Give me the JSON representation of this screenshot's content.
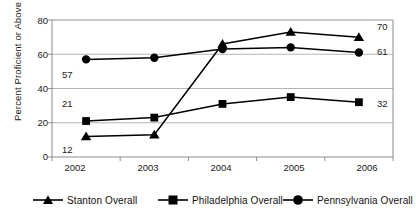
{
  "chart_data": {
    "type": "line",
    "title": "",
    "subtitle": "",
    "xlabel": "",
    "ylabel": "Percent Proficient or Above",
    "categories": [
      "2002",
      "2003",
      "2004",
      "2005",
      "2006"
    ],
    "xtick_labels": [
      "2002",
      "2003",
      "2004",
      "2005",
      "2006"
    ],
    "ytick_labels": [
      "0",
      "20",
      "40",
      "60",
      "80"
    ],
    "ytick_values": [
      0,
      20,
      40,
      60,
      80
    ],
    "ylim": [
      0,
      80
    ],
    "grid": "horizontal",
    "legend_position": "bottom",
    "series": [
      {
        "name": "Stanton Overall",
        "marker": "triangle",
        "color": "#000000",
        "values": [
          12,
          13,
          66,
          73,
          70
        ],
        "point_labels": [
          "12",
          "",
          "",
          "",
          "70"
        ]
      },
      {
        "name": "Philadelphia Overall",
        "marker": "square",
        "color": "#000000",
        "values": [
          21,
          23,
          31,
          35,
          32
        ],
        "point_labels": [
          "21",
          "",
          "",
          "",
          "32"
        ]
      },
      {
        "name": "Pennsylvania Overall",
        "marker": "circle",
        "color": "#000000",
        "values": [
          57,
          58,
          63,
          64,
          61
        ],
        "point_labels": [
          "57",
          "",
          "",
          "",
          "61"
        ]
      }
    ],
    "annotations": [
      {
        "text": "57",
        "series": "Pennsylvania Overall",
        "category": "2002",
        "placement": "below"
      },
      {
        "text": "21",
        "series": "Philadelphia Overall",
        "category": "2002",
        "placement": "above"
      },
      {
        "text": "12",
        "series": "Stanton Overall",
        "category": "2002",
        "placement": "below"
      },
      {
        "text": "70",
        "series": "Stanton Overall",
        "category": "2006",
        "placement": "right"
      },
      {
        "text": "61",
        "series": "Pennsylvania Overall",
        "category": "2006",
        "placement": "right"
      },
      {
        "text": "32",
        "series": "Philadelphia Overall",
        "category": "2006",
        "placement": "right"
      }
    ]
  },
  "legend": {
    "items": [
      {
        "label": "Stanton Overall",
        "marker": "triangle"
      },
      {
        "label": "Philadelphia Overall",
        "marker": "square"
      },
      {
        "label": "Pennsylvania Overall",
        "marker": "circle"
      }
    ]
  },
  "colors": {
    "series": "#000000",
    "grid": "#b4b4b4",
    "axis": "#8c8c8c",
    "text": "#1a1a1a",
    "background": "#ffffff"
  }
}
